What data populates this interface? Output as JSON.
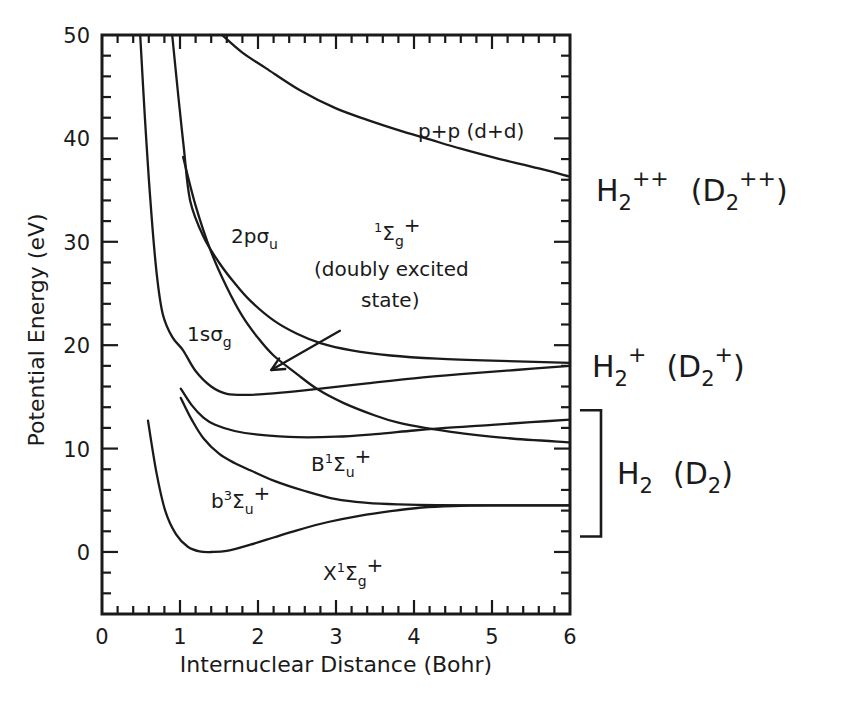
{
  "chart_data": {
    "type": "line",
    "title": "",
    "xlabel": "Internuclear Distance (Bohr)",
    "ylabel": "Potential Energy (eV)",
    "xlim": [
      0,
      6
    ],
    "ylim": [
      -6,
      50
    ],
    "xticks": [
      0,
      1,
      2,
      3,
      4,
      5,
      6
    ],
    "yticks": [
      0,
      10,
      20,
      30,
      40,
      50
    ],
    "x_minor_step": 0.2,
    "y_minor_step": 2,
    "grid": false,
    "series": [
      {
        "name": "X1Sigma_g+",
        "label": {
          "main": "X",
          "sup": "1",
          "sym": "Σ",
          "sub": "g",
          "post": "+"
        },
        "points": [
          [
            0.59,
            12.7
          ],
          [
            0.7,
            7.6
          ],
          [
            0.81,
            4.0
          ],
          [
            0.95,
            1.7
          ],
          [
            1.1,
            0.5
          ],
          [
            1.25,
            0.05
          ],
          [
            1.4,
            0.0
          ],
          [
            1.6,
            0.1
          ],
          [
            1.9,
            0.7
          ],
          [
            2.2,
            1.4
          ],
          [
            2.5,
            2.1
          ],
          [
            2.9,
            2.9
          ],
          [
            3.3,
            3.5
          ],
          [
            3.7,
            3.95
          ],
          [
            4.1,
            4.3
          ],
          [
            4.5,
            4.45
          ],
          [
            5.0,
            4.5
          ],
          [
            6.0,
            4.5
          ]
        ]
      },
      {
        "name": "b3Sigma_u+",
        "label": {
          "main": "b",
          "sup": "3",
          "sym": "Σ",
          "sub": "u",
          "post": "+"
        },
        "points": [
          [
            1.01,
            14.9
          ],
          [
            1.15,
            12.8
          ],
          [
            1.3,
            11.0
          ],
          [
            1.5,
            9.5
          ],
          [
            1.7,
            8.6
          ],
          [
            1.9,
            7.9
          ],
          [
            2.2,
            6.9
          ],
          [
            2.6,
            5.9
          ],
          [
            3.0,
            5.1
          ],
          [
            3.4,
            4.75
          ],
          [
            3.8,
            4.6
          ],
          [
            4.3,
            4.52
          ],
          [
            5.0,
            4.5
          ],
          [
            6.0,
            4.5
          ]
        ]
      },
      {
        "name": "B1Sigma_u+",
        "label": {
          "main": "B",
          "sup": "1",
          "sym": "Σ",
          "sub": "u",
          "post": "+"
        },
        "points": [
          [
            1.01,
            15.8
          ],
          [
            1.15,
            14.2
          ],
          [
            1.3,
            13.0
          ],
          [
            1.45,
            12.3
          ],
          [
            1.7,
            11.7
          ],
          [
            2.0,
            11.35
          ],
          [
            2.5,
            11.1
          ],
          [
            3.0,
            11.15
          ],
          [
            3.5,
            11.4
          ],
          [
            4.0,
            11.75
          ],
          [
            4.5,
            12.05
          ],
          [
            5.0,
            12.3
          ],
          [
            5.5,
            12.55
          ],
          [
            6.0,
            12.8
          ]
        ]
      },
      {
        "name": "1s_sigma_g",
        "label": {
          "main": "1sσ",
          "sub": "g"
        },
        "points": [
          [
            0.49,
            50
          ],
          [
            0.55,
            42
          ],
          [
            0.62,
            34
          ],
          [
            0.7,
            27
          ],
          [
            0.78,
            23
          ],
          [
            0.9,
            20.8
          ],
          [
            1.04,
            19.5
          ],
          [
            1.2,
            17.5
          ],
          [
            1.4,
            16.0
          ],
          [
            1.6,
            15.3
          ],
          [
            1.9,
            15.2
          ],
          [
            2.3,
            15.4
          ],
          [
            2.8,
            15.8
          ],
          [
            3.4,
            16.3
          ],
          [
            4.0,
            16.8
          ],
          [
            4.6,
            17.2
          ],
          [
            5.3,
            17.6
          ],
          [
            6.0,
            18.0
          ]
        ]
      },
      {
        "name": "2p_sigma_u",
        "label": {
          "main": "2pσ",
          "sub": "u"
        },
        "points": [
          [
            0.9,
            50
          ],
          [
            0.98,
            44
          ],
          [
            1.05,
            39
          ],
          [
            1.13,
            34
          ],
          [
            1.3,
            30.5
          ],
          [
            1.5,
            28.0
          ],
          [
            1.7,
            26.0
          ],
          [
            1.9,
            24.3
          ],
          [
            2.2,
            22.4
          ],
          [
            2.5,
            21.1
          ],
          [
            2.8,
            20.2
          ],
          [
            3.2,
            19.5
          ],
          [
            3.7,
            19.0
          ],
          [
            4.3,
            18.7
          ],
          [
            5.0,
            18.5
          ],
          [
            6.0,
            18.3
          ]
        ]
      },
      {
        "name": "1Sigma_g+ doubly excited",
        "label": {
          "sup": "1",
          "sym": "Σ",
          "sub": "g",
          "post": "+",
          "line2": "(doubly excited",
          "line3": "state)"
        },
        "points": [
          [
            1.04,
            38.2
          ],
          [
            1.2,
            33.5
          ],
          [
            1.4,
            29.0
          ],
          [
            1.6,
            25.6
          ],
          [
            1.8,
            22.8
          ],
          [
            2.0,
            20.7
          ],
          [
            2.2,
            19.0
          ],
          [
            2.5,
            17.2
          ],
          [
            2.77,
            15.7
          ],
          [
            3.1,
            14.4
          ],
          [
            3.5,
            13.2
          ],
          [
            3.8,
            12.5
          ],
          [
            4.14,
            12.0
          ],
          [
            4.6,
            11.5
          ],
          [
            5.2,
            11.0
          ],
          [
            6.0,
            10.6
          ]
        ]
      },
      {
        "name": "p+p (d+d)",
        "label": {
          "main": "p+p  (d+d)"
        },
        "points": [
          [
            1.54,
            50
          ],
          [
            1.8,
            48.3
          ],
          [
            2.1,
            46.8
          ],
          [
            2.55,
            44.6
          ],
          [
            3.0,
            42.9
          ],
          [
            3.4,
            41.8
          ],
          [
            3.8,
            40.8
          ],
          [
            4.2,
            39.9
          ],
          [
            4.6,
            39.0
          ],
          [
            5.1,
            38.0
          ],
          [
            5.6,
            37.1
          ],
          [
            6.0,
            36.3
          ]
        ]
      }
    ],
    "annotations": [
      {
        "id": "arrow-doubly-excited",
        "from": [
          3.05,
          21.4
        ],
        "to": [
          2.17,
          17.6
        ]
      }
    ],
    "right_labels": [
      {
        "id": "h2pp",
        "main": "H",
        "sub": "2",
        "sup": "++",
        "paren": "(D",
        "paren_sub": "2",
        "paren_sup": "++",
        "close": ")"
      },
      {
        "id": "h2p",
        "main": "H",
        "sub": "2",
        "sup": "+",
        "paren": "(D",
        "paren_sub": "2",
        "paren_sup": "+",
        "close": ")"
      },
      {
        "id": "h2",
        "main": "H",
        "sub": "2",
        "paren": "(D",
        "paren_sub": "2",
        "close": ")",
        "bracket_range_eV": [
          1.5,
          13.7
        ]
      }
    ]
  }
}
